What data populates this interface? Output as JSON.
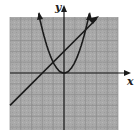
{
  "chart_data": {
    "type": "line",
    "title": "",
    "xlabel": "x",
    "ylabel": "y",
    "xlim": [
      -5,
      5
    ],
    "ylim": [
      -5,
      5
    ],
    "grid": true,
    "series": [
      {
        "name": "parabola",
        "equation": "y = x^2",
        "x": [
          -2.3,
          -2,
          -1,
          0,
          1,
          2,
          2.3
        ],
        "values": [
          5.29,
          4,
          1,
          0,
          1,
          4,
          5.29
        ]
      },
      {
        "name": "line",
        "equation": "y = x + 2",
        "x": [
          -5,
          -2,
          -1,
          0,
          2,
          3
        ],
        "values": [
          -3,
          0,
          1,
          2,
          4,
          5
        ]
      }
    ],
    "intersections": [
      [
        -1,
        1
      ],
      [
        2,
        4
      ]
    ]
  },
  "axes": {
    "x_label": "x",
    "y_label": "y"
  },
  "colors": {
    "grid_bg": "#a8a8a8",
    "grid_line": "#8a8a8a",
    "curve": "#1a1a1a"
  }
}
